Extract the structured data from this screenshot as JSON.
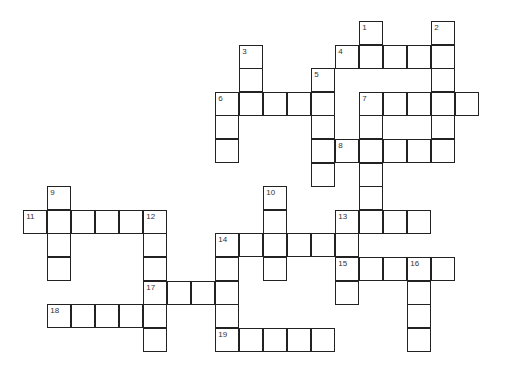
{
  "puzzle": {
    "cell_size": 24,
    "origin_x": 24,
    "origin_y": 22,
    "row_pitch": 23.6,
    "cells": [
      [
        0,
        14,
        "1"
      ],
      [
        1,
        14,
        ""
      ],
      [
        0,
        17,
        "2"
      ],
      [
        1,
        17,
        ""
      ],
      [
        2,
        17,
        ""
      ],
      [
        3,
        17,
        ""
      ],
      [
        4,
        17,
        ""
      ],
      [
        5,
        17,
        ""
      ],
      [
        1,
        13,
        "4"
      ],
      [
        1,
        15,
        ""
      ],
      [
        1,
        16,
        ""
      ],
      [
        1,
        9,
        "3"
      ],
      [
        2,
        9,
        ""
      ],
      [
        3,
        9,
        ""
      ],
      [
        2,
        12,
        "5"
      ],
      [
        3,
        12,
        ""
      ],
      [
        4,
        12,
        ""
      ],
      [
        5,
        12,
        ""
      ],
      [
        6,
        12,
        ""
      ],
      [
        3,
        8,
        "6"
      ],
      [
        3,
        10,
        ""
      ],
      [
        3,
        11,
        ""
      ],
      [
        4,
        8,
        ""
      ],
      [
        5,
        8,
        ""
      ],
      [
        3,
        14,
        "7"
      ],
      [
        3,
        15,
        ""
      ],
      [
        3,
        16,
        ""
      ],
      [
        3,
        18,
        ""
      ],
      [
        4,
        14,
        ""
      ],
      [
        5,
        14,
        ""
      ],
      [
        6,
        14,
        ""
      ],
      [
        7,
        14,
        ""
      ],
      [
        8,
        14,
        ""
      ],
      [
        5,
        13,
        "8"
      ],
      [
        5,
        15,
        ""
      ],
      [
        5,
        16,
        ""
      ],
      [
        7,
        1,
        "9"
      ],
      [
        8,
        1,
        ""
      ],
      [
        9,
        1,
        ""
      ],
      [
        10,
        1,
        ""
      ],
      [
        8,
        0,
        "11"
      ],
      [
        8,
        2,
        ""
      ],
      [
        8,
        3,
        ""
      ],
      [
        8,
        4,
        ""
      ],
      [
        8,
        5,
        "12"
      ],
      [
        9,
        5,
        ""
      ],
      [
        10,
        5,
        ""
      ],
      [
        11,
        5,
        ""
      ],
      [
        12,
        5,
        ""
      ],
      [
        13,
        5,
        ""
      ],
      [
        7,
        10,
        "10"
      ],
      [
        8,
        10,
        ""
      ],
      [
        9,
        10,
        ""
      ],
      [
        10,
        10,
        ""
      ],
      [
        8,
        13,
        "13"
      ],
      [
        8,
        15,
        ""
      ],
      [
        8,
        16,
        ""
      ],
      [
        9,
        13,
        ""
      ],
      [
        10,
        13,
        ""
      ],
      [
        11,
        13,
        ""
      ],
      [
        9,
        8,
        "14"
      ],
      [
        9,
        9,
        ""
      ],
      [
        9,
        11,
        ""
      ],
      [
        9,
        12,
        ""
      ],
      [
        10,
        8,
        ""
      ],
      [
        11,
        8,
        ""
      ],
      [
        12,
        8,
        ""
      ],
      [
        13,
        8,
        ""
      ],
      [
        10,
        13,
        "15"
      ],
      [
        10,
        14,
        ""
      ],
      [
        10,
        15,
        ""
      ],
      [
        10,
        16,
        "16"
      ],
      [
        10,
        17,
        ""
      ],
      [
        11,
        16,
        ""
      ],
      [
        12,
        16,
        ""
      ],
      [
        13,
        16,
        ""
      ],
      [
        11,
        5,
        "17"
      ],
      [
        11,
        6,
        ""
      ],
      [
        11,
        7,
        ""
      ],
      [
        12,
        1,
        "18"
      ],
      [
        12,
        2,
        ""
      ],
      [
        12,
        3,
        ""
      ],
      [
        12,
        4,
        ""
      ],
      [
        13,
        8,
        "19"
      ],
      [
        13,
        9,
        ""
      ],
      [
        13,
        10,
        ""
      ],
      [
        13,
        11,
        ""
      ],
      [
        13,
        12,
        ""
      ]
    ]
  }
}
